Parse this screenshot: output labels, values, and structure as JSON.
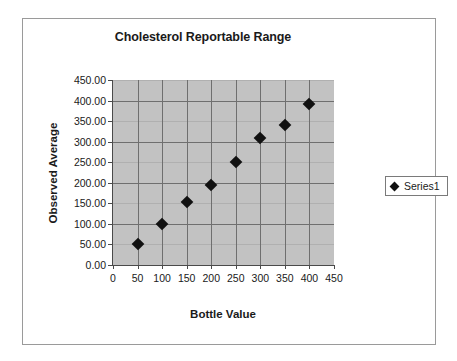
{
  "chart_data": {
    "type": "scatter",
    "title": "Cholesterol Reportable Range",
    "xlabel": "Bottle Value",
    "ylabel": "Observed Average",
    "xlim": [
      0,
      450
    ],
    "ylim": [
      0,
      450
    ],
    "xticks": [
      "0",
      "50",
      "100",
      "150",
      "200",
      "250",
      "300",
      "350",
      "400",
      "450"
    ],
    "xtick_values": [
      0,
      50,
      100,
      150,
      200,
      250,
      300,
      350,
      400,
      450
    ],
    "yticks": [
      "0.00",
      "50.00",
      "100.00",
      "150.00",
      "200.00",
      "250.00",
      "300.00",
      "350.00",
      "400.00",
      "450.00"
    ],
    "ytick_values": [
      0,
      50,
      100,
      150,
      200,
      250,
      300,
      350,
      400,
      450
    ],
    "grid": true,
    "legend_position": "right",
    "plot_background": "#c2c2c2",
    "marker_color": "#111111",
    "marker_shape": "diamond",
    "series": [
      {
        "name": "Series1",
        "x": [
          50,
          100,
          150,
          200,
          250,
          300,
          350,
          400
        ],
        "y": [
          50,
          100,
          153,
          195,
          251,
          309,
          341,
          391
        ],
        "points": [
          {
            "x": 50,
            "y": 50
          },
          {
            "x": 100,
            "y": 100
          },
          {
            "x": 150,
            "y": 153
          },
          {
            "x": 200,
            "y": 195
          },
          {
            "x": 250,
            "y": 251
          },
          {
            "x": 300,
            "y": 309
          },
          {
            "x": 350,
            "y": 341
          },
          {
            "x": 400,
            "y": 391
          }
        ]
      }
    ]
  },
  "legend": {
    "entries": [
      {
        "label": "Series1",
        "marker": "diamond-marker-icon"
      }
    ]
  }
}
